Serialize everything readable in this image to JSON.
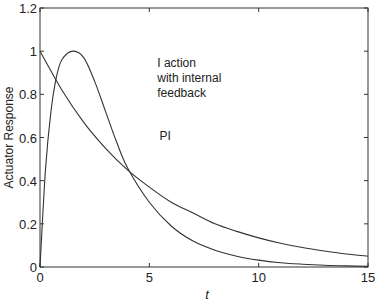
{
  "chart_data": {
    "type": "line",
    "title": "",
    "xlabel": "t",
    "ylabel": "Actuator Response",
    "xlim": [
      0,
      15
    ],
    "ylim": [
      0,
      1.2
    ],
    "xticks": [
      "0",
      "5",
      "10",
      "15"
    ],
    "yticks": [
      "0",
      "0.2",
      "0.4",
      "0.6",
      "0.8",
      "1",
      "1.2"
    ],
    "grid": false,
    "legend": "none (inline annotations)",
    "series": [
      {
        "name": "PI",
        "x": [
          0,
          1,
          2,
          3,
          4,
          5,
          6,
          7,
          8,
          9,
          10,
          11,
          12,
          13,
          14,
          15
        ],
        "y": [
          1.0,
          0.82,
          0.67,
          0.55,
          0.45,
          0.37,
          0.3,
          0.25,
          0.2,
          0.165,
          0.135,
          0.11,
          0.09,
          0.074,
          0.06,
          0.05
        ]
      },
      {
        "name": "I action with internal feedback",
        "x": [
          0,
          0.25,
          0.5,
          0.75,
          1,
          1.5,
          2,
          2.5,
          3,
          3.5,
          4,
          5,
          6,
          7,
          8,
          9,
          10,
          11,
          12,
          13,
          14,
          15
        ],
        "y": [
          0,
          0.45,
          0.72,
          0.88,
          0.96,
          1.0,
          0.97,
          0.86,
          0.72,
          0.58,
          0.46,
          0.3,
          0.19,
          0.12,
          0.078,
          0.05,
          0.032,
          0.02,
          0.013,
          0.008,
          0.005,
          0.003
        ]
      }
    ],
    "annotations": [
      {
        "text": "PI",
        "x": 5.6,
        "y": 0.61
      },
      {
        "text": "I action",
        "x": 5.5,
        "y": 0.95
      },
      {
        "text": "with internal",
        "x": 5.5,
        "y": 0.88
      },
      {
        "text": "feedback",
        "x": 5.5,
        "y": 0.81
      }
    ]
  }
}
